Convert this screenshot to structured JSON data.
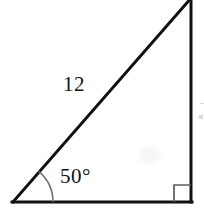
{
  "figure": {
    "type": "right-triangle-diagram",
    "background_color": "#ffffff",
    "stroke_color": "#111111",
    "stroke_width": 3,
    "canvas": {
      "width": 204,
      "height": 215
    },
    "labels": {
      "hypotenuse_length": "12",
      "base_angle": "50°"
    },
    "vertices": {
      "bottom_left": {
        "x": 13,
        "y": 202
      },
      "bottom_right": {
        "x": 191,
        "y": 202
      },
      "apex_top": {
        "x": 191,
        "y": 0
      }
    },
    "markers": {
      "angle_arc": {
        "name": "angle-arc-50",
        "center_x": 13,
        "center_y": 202,
        "radius": 40,
        "measure": "50°"
      },
      "right_angle_square": {
        "name": "right-angle-marker",
        "corner_x": 191,
        "corner_y": 202,
        "size": 17,
        "measure": "90°"
      }
    },
    "notes": {
      "apex_clipped": "top vertex is clipped by the top edge of the image",
      "edge_artifact": "faint clipped mark at the right edge of the image"
    }
  }
}
